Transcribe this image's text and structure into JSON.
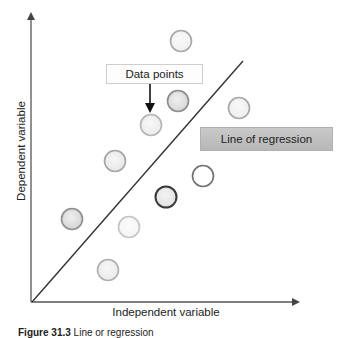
{
  "diagram": {
    "axes": {
      "x_label": "Independent variable",
      "y_label": "Dependent variable"
    },
    "callouts": {
      "data_points": "Data points",
      "line_of_regression": "Line of regression"
    },
    "caption": {
      "figure_number": "Figure 31.3",
      "text": "Line or regression"
    },
    "points": [
      {
        "id": 1,
        "cx": 181,
        "cy": 41,
        "fill": "#f0f0f0",
        "stroke": "#a8a8a8",
        "side": "above"
      },
      {
        "id": 2,
        "cx": 178,
        "cy": 101,
        "fill": "#d8d8d8",
        "stroke": "#8c8c8c",
        "side": "above"
      },
      {
        "id": 3,
        "cx": 151,
        "cy": 125,
        "fill": "#ececec",
        "stroke": "#b5b5b5",
        "side": "above",
        "annotated": true
      },
      {
        "id": 4,
        "cx": 115,
        "cy": 161,
        "fill": "#e8e8e8",
        "stroke": "#a5a5a5",
        "side": "above"
      },
      {
        "id": 5,
        "cx": 72,
        "cy": 219,
        "fill": "#d6d6d6",
        "stroke": "#8e8e8e",
        "side": "above"
      },
      {
        "id": 6,
        "cx": 239,
        "cy": 108,
        "fill": "#efefef",
        "stroke": "#a8a8a8",
        "side": "below"
      },
      {
        "id": 7,
        "cx": 203,
        "cy": 176,
        "fill": "#ffffff",
        "stroke": "#707070",
        "side": "below"
      },
      {
        "id": 8,
        "cx": 166,
        "cy": 197,
        "fill": "#e2e2e2",
        "stroke": "#3a3a3a",
        "side": "below"
      },
      {
        "id": 9,
        "cx": 129,
        "cy": 227,
        "fill": "#f5f5f5",
        "stroke": "#c4c4c4",
        "side": "below"
      },
      {
        "id": 10,
        "cx": 108,
        "cy": 270,
        "fill": "#ebebeb",
        "stroke": "#b0b0b0",
        "side": "below"
      }
    ],
    "regression_line": {
      "x1": 32,
      "y1": 302,
      "x2": 243,
      "y2": 61,
      "color": "#333333"
    },
    "colors": {
      "axis": "#555555",
      "callout_line_bg": "#c2c2c2",
      "callout_data_bg": "#fdfdfd"
    }
  }
}
